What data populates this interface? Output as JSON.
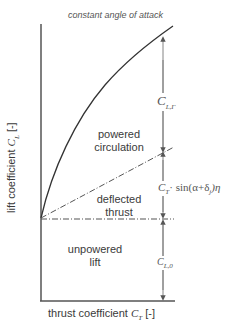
{
  "title": "constant angle of attack",
  "axes": {
    "y_label_prefix": "lift coefficient ",
    "y_symbol": "C",
    "y_sub": "L",
    "y_unit": " [-]",
    "x_label_prefix": "thrust coefficient ",
    "x_symbol": "C",
    "x_sub": "T",
    "x_unit": " [-]"
  },
  "regions": {
    "powered_circulation": [
      "powered",
      "circulation"
    ],
    "deflected_thrust": [
      "deflected",
      "thrust"
    ],
    "unpowered_lift": [
      "unpowered",
      "lift"
    ]
  },
  "annotations": {
    "cl_gamma": {
      "symbol": "C",
      "sub": "L,Γ"
    },
    "thrust_term": {
      "symbol": "C",
      "sub": "T",
      "expr": "· sin(α+δ",
      "sub2": "j",
      "tail": ")η"
    },
    "cl_zero": {
      "symbol": "C",
      "sub": "L,0"
    }
  },
  "colors": {
    "axis": "#555555",
    "curve": "#333333",
    "arrow": "#777777",
    "dashed": "#555555"
  }
}
